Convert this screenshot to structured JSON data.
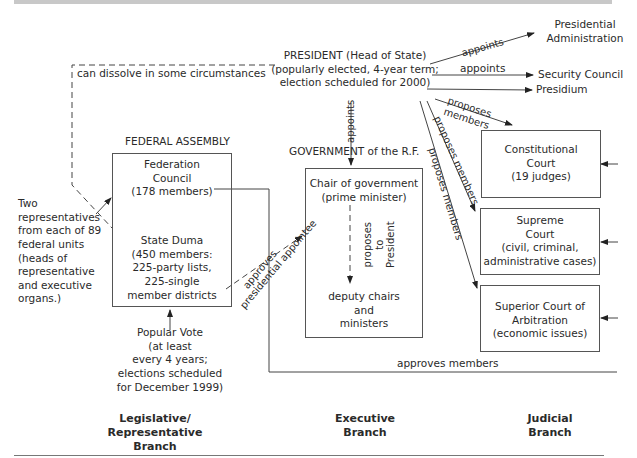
{
  "header": {
    "title_fragment": "... 1993 to the Present"
  },
  "executive": {
    "president": {
      "line1": "PRESIDENT (Head of State)",
      "line2": "(popularly elected, 4-year term;",
      "line3": "election scheduled for 2000)"
    },
    "presidential_administration": {
      "line1": "Presidential",
      "line2": "Administration"
    },
    "security_council": "Security Council",
    "presidium": "Presidium",
    "government_title": "GOVERNMENT of the R.F.",
    "chair": {
      "line1": "Chair of government",
      "line2": "(prime minister)"
    },
    "deputies": {
      "line1": "deputy chairs",
      "line2": "and",
      "line3": "ministers"
    },
    "proposes_to_president": {
      "line1": "proposes",
      "line2": "to",
      "line3": "President"
    }
  },
  "legislative": {
    "title": "FEDERAL ASSEMBLY",
    "federation_council": {
      "line1": "Federation",
      "line2": "Council",
      "line3": "(178 members)"
    },
    "state_duma": {
      "line1": "State Duma",
      "line2": "(450 members:",
      "line3": "225-party lists,",
      "line4": "225-single",
      "line5": "member districts"
    },
    "two_reps": [
      "Two",
      "representatives",
      "from each of 89",
      "federal units",
      "(heads of",
      "representative",
      "and executive",
      "organs.)"
    ],
    "popular_vote": [
      "Popular Vote",
      "(at least",
      "every 4 years;",
      "elections scheduled",
      "for December 1999)"
    ]
  },
  "judicial": {
    "constitutional": {
      "line1": "Constitutional",
      "line2": "Court",
      "line3": "(19 judges)"
    },
    "supreme": {
      "line1": "Supreme",
      "line2": "Court",
      "line3": "(civil, criminal,",
      "line4": "administrative cases)"
    },
    "arbitration": {
      "line1": "Superior Court of",
      "line2": "Arbitration",
      "line3": "(economic issues)"
    }
  },
  "edges": {
    "can_dissolve": "can dissolve in some circumstances",
    "appoints_admin": "appoints",
    "appoints_security": "appoints",
    "appoints_government": "appoints",
    "proposes_members_1a": "proposes",
    "proposes_members_1b": "members",
    "proposes_members_2": "proposes members",
    "proposes_members_3": "proposes members",
    "approves": "approves",
    "presidential_appointee": "presidential appointee",
    "approves_members": "approves members"
  },
  "branches": {
    "legislative": {
      "line1": "Legislative/",
      "line2": "Representative",
      "line3": "Branch"
    },
    "executive": {
      "line1": "Executive",
      "line2": "Branch"
    },
    "judicial": {
      "line1": "Judicial",
      "line2": "Branch"
    }
  }
}
